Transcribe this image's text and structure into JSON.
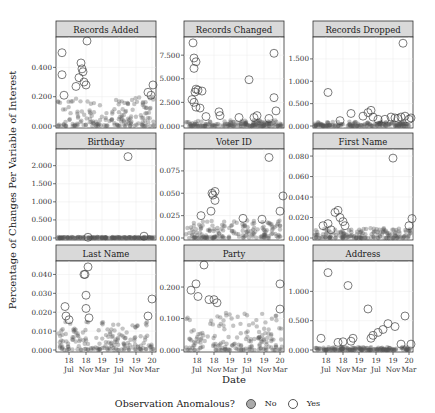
{
  "chart_data": {
    "type": "scatter",
    "layout": "facet_wrap 3x3",
    "xlabel": "Date",
    "ylabel": "Percentage of Changes Per Variable of Interest",
    "x_tick_labels": [
      "18\nJul",
      "18\nNov",
      "19\nMar",
      "19\nJul",
      "19\nNov",
      "20\nMar"
    ],
    "legend": {
      "title": "Observation Anomalous?",
      "entries": [
        "No",
        "Yes"
      ],
      "position": "bottom"
    },
    "grid": true,
    "panels": [
      {
        "title": "Records Added",
        "yticks": [
          "0.000",
          "0.200",
          "0.400"
        ],
        "ylim": [
          0,
          0.58
        ],
        "baseline_max": 0.2,
        "anomalies": [
          [
            0.06,
            0.5
          ],
          [
            0.06,
            0.35
          ],
          [
            0.08,
            0.21
          ],
          [
            0.2,
            0.27
          ],
          [
            0.23,
            0.33
          ],
          [
            0.25,
            0.43
          ],
          [
            0.26,
            0.39
          ],
          [
            0.27,
            0.37
          ],
          [
            0.28,
            0.3
          ],
          [
            0.3,
            0.28
          ],
          [
            0.31,
            0.58
          ],
          [
            0.92,
            0.23
          ],
          [
            0.95,
            0.21
          ],
          [
            0.97,
            0.28
          ]
        ]
      },
      {
        "title": "Records Changed",
        "yticks": [
          "0.000",
          "2.500",
          "5.000",
          "7.500"
        ],
        "ylim": [
          0,
          9.0
        ],
        "baseline_max": 0.6,
        "anomalies": [
          [
            0.09,
            8.8
          ],
          [
            0.1,
            7.2
          ],
          [
            0.12,
            6.8
          ],
          [
            0.1,
            6.1
          ],
          [
            0.12,
            3.9
          ],
          [
            0.11,
            3.6
          ],
          [
            0.14,
            3.8
          ],
          [
            0.18,
            3.7
          ],
          [
            0.08,
            2.8
          ],
          [
            0.1,
            2.5
          ],
          [
            0.12,
            2.0
          ],
          [
            0.16,
            1.9
          ],
          [
            0.22,
            1.0
          ],
          [
            0.35,
            1.5
          ],
          [
            0.36,
            1.1
          ],
          [
            0.55,
            0.9
          ],
          [
            0.65,
            4.9
          ],
          [
            0.7,
            0.9
          ],
          [
            0.73,
            1.1
          ],
          [
            0.85,
            0.8
          ],
          [
            0.9,
            7.7
          ],
          [
            0.9,
            3.0
          ],
          [
            0.92,
            1.6
          ]
        ]
      },
      {
        "title": "Records Dropped",
        "yticks": [
          "0.000",
          "0.500",
          "1.000",
          "1.500"
        ],
        "ylim": [
          0,
          1.9
        ],
        "baseline_max": 0.1,
        "anomalies": [
          [
            0.15,
            0.75
          ],
          [
            0.27,
            0.12
          ],
          [
            0.38,
            0.28
          ],
          [
            0.5,
            0.22
          ],
          [
            0.55,
            0.3
          ],
          [
            0.58,
            0.35
          ],
          [
            0.6,
            0.2
          ],
          [
            0.65,
            0.15
          ],
          [
            0.72,
            0.15
          ],
          [
            0.78,
            0.2
          ],
          [
            0.82,
            0.18
          ],
          [
            0.85,
            0.17
          ],
          [
            0.88,
            0.2
          ],
          [
            0.9,
            1.85
          ],
          [
            0.92,
            0.22
          ],
          [
            0.96,
            0.15
          ],
          [
            0.98,
            0.18
          ]
        ]
      },
      {
        "title": "Birthday",
        "yticks": [
          "0.000",
          "0.500",
          "1.000",
          "1.500",
          "2.000"
        ],
        "ylim": [
          0,
          2.35
        ],
        "baseline_max": 0.03,
        "anomalies": [
          [
            0.32,
            0.02
          ],
          [
            0.72,
            2.25
          ],
          [
            0.88,
            0.05
          ]
        ]
      },
      {
        "title": "Voter ID",
        "yticks": [
          "0.000",
          "0.025",
          "0.050",
          "0.075"
        ],
        "ylim": [
          0,
          0.095
        ],
        "baseline_max": 0.02,
        "anomalies": [
          [
            0.17,
            0.025
          ],
          [
            0.27,
            0.03
          ],
          [
            0.28,
            0.05
          ],
          [
            0.29,
            0.048
          ],
          [
            0.31,
            0.042
          ],
          [
            0.31,
            0.052
          ],
          [
            0.59,
            0.022
          ],
          [
            0.78,
            0.021
          ],
          [
            0.85,
            0.09
          ],
          [
            0.96,
            0.03
          ],
          [
            0.99,
            0.047
          ]
        ]
      },
      {
        "title": "First Name",
        "yticks": [
          "0.000",
          "0.020",
          "0.040",
          "0.060",
          "0.080"
        ],
        "ylim": [
          0,
          0.083
        ],
        "baseline_max": 0.01,
        "anomalies": [
          [
            0.1,
            0.012
          ],
          [
            0.15,
            0.014
          ],
          [
            0.18,
            0.008
          ],
          [
            0.22,
            0.025
          ],
          [
            0.25,
            0.027
          ],
          [
            0.27,
            0.02
          ],
          [
            0.3,
            0.016
          ],
          [
            0.32,
            0.012
          ],
          [
            0.8,
            0.078
          ],
          [
            0.96,
            0.012
          ],
          [
            0.99,
            0.019
          ]
        ]
      },
      {
        "title": "Last Name",
        "yticks": [
          "0.000",
          "0.010",
          "0.020",
          "0.030",
          "0.040"
        ],
        "ylim": [
          0,
          0.045
        ],
        "baseline_max": 0.015,
        "anomalies": [
          [
            0.09,
            0.023
          ],
          [
            0.1,
            0.018
          ],
          [
            0.13,
            0.016
          ],
          [
            0.28,
            0.04
          ],
          [
            0.29,
            0.04
          ],
          [
            0.32,
            0.044
          ],
          [
            0.3,
            0.029
          ],
          [
            0.3,
            0.022
          ],
          [
            0.33,
            0.017
          ],
          [
            0.92,
            0.018
          ],
          [
            0.96,
            0.027
          ]
        ]
      },
      {
        "title": "Party",
        "yticks": [
          "0.000",
          "0.100",
          "0.200"
        ],
        "ylim": [
          0,
          0.27
        ],
        "baseline_max": 0.12,
        "anomalies": [
          [
            0.07,
            0.19
          ],
          [
            0.12,
            0.21
          ],
          [
            0.14,
            0.17
          ],
          [
            0.2,
            0.27
          ],
          [
            0.25,
            0.16
          ],
          [
            0.3,
            0.16
          ],
          [
            0.33,
            0.15
          ],
          [
            0.96,
            0.21
          ],
          [
            0.96,
            0.13
          ]
        ]
      },
      {
        "title": "Address",
        "yticks": [
          "0.000",
          "0.500",
          "1.000"
        ],
        "ylim": [
          0,
          1.45
        ],
        "baseline_max": 0.05,
        "anomalies": [
          [
            0.08,
            0.2
          ],
          [
            0.15,
            1.32
          ],
          [
            0.25,
            0.13
          ],
          [
            0.3,
            0.14
          ],
          [
            0.35,
            1.1
          ],
          [
            0.38,
            0.15
          ],
          [
            0.4,
            0.2
          ],
          [
            0.55,
            0.7
          ],
          [
            0.58,
            0.2
          ],
          [
            0.6,
            0.25
          ],
          [
            0.65,
            0.3
          ],
          [
            0.7,
            0.35
          ],
          [
            0.75,
            0.45
          ],
          [
            0.82,
            0.4
          ],
          [
            0.88,
            0.1
          ],
          [
            0.92,
            0.58
          ],
          [
            0.98,
            0.1
          ]
        ]
      }
    ]
  },
  "labels": {
    "xlabel": "Date",
    "ylabel": "Percentage of Changes Per Variable of Interest",
    "legend_title": "Observation Anomalous?",
    "legend_no": "No",
    "legend_yes": "Yes"
  },
  "colors": {
    "strip_bg": "#d9d9d9",
    "panel_border": "#333333",
    "normal_point": "#555555",
    "anomaly_stroke": "#444444",
    "grid": "#ebebeb"
  }
}
